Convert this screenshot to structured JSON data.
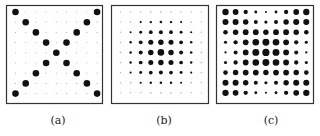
{
  "figure": {
    "grid_size": 9,
    "colors": {
      "dot": "#111111",
      "faint_dot": "#bbbbbb",
      "frame": "#333333"
    },
    "panels": [
      {
        "id": "a",
        "label": "(a)",
        "description": "X-shaped pattern: dots on both diagonals",
        "values": [
          [
            1,
            0,
            0,
            0,
            0,
            0,
            0,
            0,
            1
          ],
          [
            0,
            1,
            0,
            0,
            0,
            0,
            0,
            1,
            0
          ],
          [
            0,
            0,
            1,
            0,
            0,
            0,
            1,
            0,
            0
          ],
          [
            0,
            0,
            0,
            1,
            0,
            1,
            0,
            0,
            0
          ],
          [
            0,
            0,
            0,
            0,
            1,
            0,
            0,
            0,
            0
          ],
          [
            0,
            0,
            0,
            1,
            0,
            1,
            0,
            0,
            0
          ],
          [
            0,
            0,
            1,
            0,
            0,
            0,
            1,
            0,
            0
          ],
          [
            0,
            1,
            0,
            0,
            0,
            0,
            0,
            1,
            0
          ],
          [
            1,
            0,
            0,
            0,
            0,
            0,
            0,
            0,
            1
          ]
        ]
      },
      {
        "id": "b",
        "label": "(b)",
        "description": "Gaussian kernel centered in grid",
        "values": [
          [
            0.02,
            0.04,
            0.06,
            0.08,
            0.09,
            0.08,
            0.06,
            0.04,
            0.02
          ],
          [
            0.04,
            0.08,
            0.14,
            0.2,
            0.22,
            0.2,
            0.14,
            0.08,
            0.04
          ],
          [
            0.06,
            0.14,
            0.3,
            0.45,
            0.5,
            0.45,
            0.3,
            0.14,
            0.06
          ],
          [
            0.08,
            0.2,
            0.45,
            0.7,
            0.78,
            0.7,
            0.45,
            0.2,
            0.08
          ],
          [
            0.09,
            0.22,
            0.5,
            0.78,
            1.0,
            0.78,
            0.5,
            0.22,
            0.09
          ],
          [
            0.08,
            0.2,
            0.45,
            0.7,
            0.78,
            0.7,
            0.45,
            0.2,
            0.08
          ],
          [
            0.06,
            0.14,
            0.3,
            0.45,
            0.5,
            0.45,
            0.3,
            0.14,
            0.06
          ],
          [
            0.04,
            0.08,
            0.14,
            0.2,
            0.22,
            0.2,
            0.14,
            0.08,
            0.04
          ],
          [
            0.02,
            0.04,
            0.06,
            0.08,
            0.09,
            0.08,
            0.06,
            0.04,
            0.02
          ]
        ]
      },
      {
        "id": "c",
        "label": "(c)",
        "description": "X pattern blurred by Gaussian",
        "values": [
          [
            0.85,
            0.75,
            0.5,
            0.25,
            0.12,
            0.25,
            0.5,
            0.75,
            0.85
          ],
          [
            0.8,
            0.8,
            0.7,
            0.45,
            0.3,
            0.45,
            0.7,
            0.8,
            0.8
          ],
          [
            0.55,
            0.7,
            0.75,
            0.75,
            0.7,
            0.75,
            0.75,
            0.7,
            0.55
          ],
          [
            0.3,
            0.5,
            0.75,
            0.9,
            0.95,
            0.9,
            0.75,
            0.5,
            0.3
          ],
          [
            0.15,
            0.45,
            0.75,
            0.95,
            1.0,
            0.95,
            0.75,
            0.45,
            0.15
          ],
          [
            0.3,
            0.5,
            0.75,
            0.9,
            0.95,
            0.9,
            0.75,
            0.5,
            0.3
          ],
          [
            0.55,
            0.7,
            0.75,
            0.75,
            0.7,
            0.75,
            0.75,
            0.7,
            0.55
          ],
          [
            0.8,
            0.8,
            0.7,
            0.45,
            0.3,
            0.45,
            0.7,
            0.8,
            0.8
          ],
          [
            0.85,
            0.75,
            0.5,
            0.25,
            0.12,
            0.25,
            0.5,
            0.75,
            0.85
          ]
        ]
      }
    ]
  }
}
